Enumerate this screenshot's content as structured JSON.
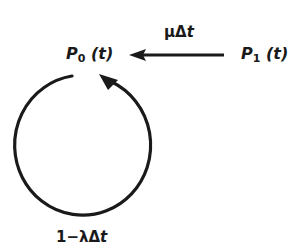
{
  "diagram": {
    "type": "state-transition",
    "colors": {
      "stroke": "#1a1a1a",
      "background": "#ffffff"
    },
    "states": [
      {
        "id": "P0",
        "symbol": "P",
        "subscript": "0",
        "arg": "(t)"
      },
      {
        "id": "P1",
        "symbol": "P",
        "subscript": "1",
        "arg": "(t)"
      }
    ],
    "transitions": [
      {
        "from": "P1",
        "to": "P0",
        "label": {
          "prefix": "μΔ",
          "var": "t"
        }
      },
      {
        "from": "P0",
        "to": "P0",
        "kind": "self-loop",
        "label": {
          "prefix": "1−λΔ",
          "var": "t"
        }
      }
    ]
  }
}
